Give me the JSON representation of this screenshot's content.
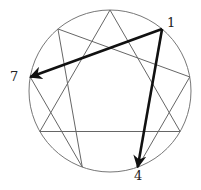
{
  "diagram": {
    "type": "enneagram",
    "colors": {
      "line": "#666666",
      "arrow": "#111111",
      "circle": "#777777"
    },
    "points": [
      "9",
      "1",
      "2",
      "3",
      "4",
      "5",
      "6",
      "7",
      "8"
    ],
    "triangle": [
      "9",
      "3",
      "6"
    ],
    "hexad": [
      "1",
      "4",
      "2",
      "8",
      "5",
      "7"
    ],
    "arrows": [
      {
        "from": "1",
        "to": "7"
      },
      {
        "from": "1",
        "to": "4"
      }
    ],
    "labels": [
      {
        "point": "1",
        "text": "1"
      },
      {
        "point": "7",
        "text": "7"
      },
      {
        "point": "4",
        "text": "4"
      }
    ]
  }
}
